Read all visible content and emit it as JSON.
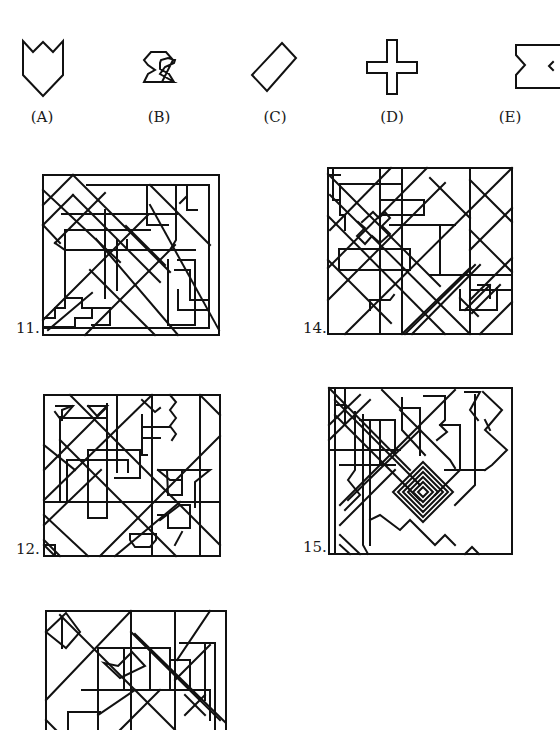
{
  "options": [
    {
      "letter": "(A)",
      "shape": "shield-crown"
    },
    {
      "letter": "(B)",
      "shape": "hourglass-hexagon"
    },
    {
      "letter": "(C)",
      "shape": "rotated-rectangle"
    },
    {
      "letter": "(D)",
      "shape": "plus-cross"
    },
    {
      "letter": "(E)",
      "shape": "notched-rectangle"
    }
  ],
  "figures": [
    {
      "number": "11."
    },
    {
      "number": "14."
    },
    {
      "number": "12."
    },
    {
      "number": "15."
    },
    {
      "number": "13."
    }
  ]
}
